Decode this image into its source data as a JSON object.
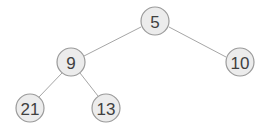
{
  "diagram": {
    "type": "binary-tree",
    "colors": {
      "node_fill": "#ececec",
      "node_stroke": "#9a9a9a",
      "edge": "#a6a6a6",
      "text": "#404040"
    },
    "nodes": [
      {
        "id": "n5",
        "label": "5",
        "x": 155,
        "y": 21,
        "r": 14
      },
      {
        "id": "n9",
        "label": "9",
        "x": 71,
        "y": 62,
        "r": 14
      },
      {
        "id": "n10",
        "label": "10",
        "x": 240,
        "y": 62,
        "r": 14
      },
      {
        "id": "n21",
        "label": "21",
        "x": 30,
        "y": 108,
        "r": 14
      },
      {
        "id": "n13",
        "label": "13",
        "x": 106,
        "y": 108,
        "r": 14
      }
    ],
    "edges": [
      {
        "from": "n5",
        "to": "n9"
      },
      {
        "from": "n5",
        "to": "n10"
      },
      {
        "from": "n9",
        "to": "n21"
      },
      {
        "from": "n9",
        "to": "n13"
      }
    ]
  }
}
